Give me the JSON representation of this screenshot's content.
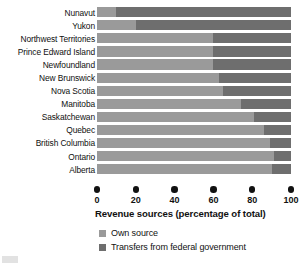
{
  "chart_data": {
    "type": "bar",
    "orientation": "horizontal",
    "stacked": true,
    "title": "",
    "xlabel": "Revenue sources (percentage of total)",
    "ylabel": "",
    "xlim": [
      0,
      100
    ],
    "xticks": [
      0,
      20,
      40,
      60,
      80,
      100
    ],
    "xtick_labels": [
      "0",
      "20",
      "40",
      "60",
      "80",
      "100"
    ],
    "grid": false,
    "legend_position": "bottom-left",
    "categories": [
      "Nunavut",
      "Yukon",
      "Northwest Territories",
      "Prince Edward Island",
      "Newfoundland",
      "New Brunswick",
      "Nova Scotia",
      "Manitoba",
      "Saskatchewan",
      "Quebec",
      "British Columbia",
      "Ontario",
      "Alberta"
    ],
    "series": [
      {
        "name": "Own source",
        "color": "#9a9a9a",
        "values": [
          10,
          20,
          60,
          60,
          60,
          63,
          65,
          74,
          81,
          86,
          89,
          91,
          90
        ]
      },
      {
        "name": "Transfers from federal government",
        "color": "#6e6e6e",
        "values": [
          90,
          80,
          40,
          40,
          40,
          37,
          35,
          26,
          19,
          14,
          11,
          9,
          10
        ]
      }
    ]
  },
  "legend": {
    "items": [
      {
        "label": "Own source",
        "color": "#9a9a9a"
      },
      {
        "label": "Transfers from federal government",
        "color": "#6e6e6e"
      }
    ]
  }
}
